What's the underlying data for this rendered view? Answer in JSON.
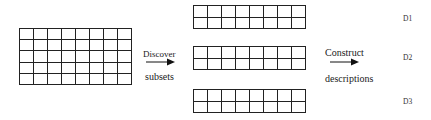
{
  "diagram": {
    "source_grid": {
      "rows": 5,
      "cols": 8
    },
    "step1": {
      "top_label": "Discover",
      "bottom_label": "subsets"
    },
    "subset_grids": [
      {
        "rows": 2,
        "cols": 8
      },
      {
        "rows": 2,
        "cols": 8
      },
      {
        "rows": 2,
        "cols": 8
      }
    ],
    "step2": {
      "top_label": "Construct",
      "bottom_label": "descriptions"
    },
    "descriptions": [
      "D1",
      "D2",
      "D3"
    ],
    "colors": {
      "line": "#222222",
      "background": "#ffffff",
      "text": "#1a1a1a"
    }
  }
}
